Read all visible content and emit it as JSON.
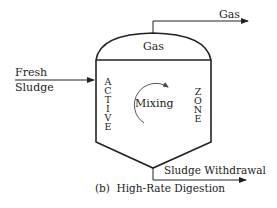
{
  "diagram": {
    "title": "(b)  High-Rate Digestion",
    "labels": {
      "gas_outlet": "Gas",
      "gas_dome": "Gas",
      "fresh_sludge_line1": "Fresh",
      "fresh_sludge_line2": "Sludge",
      "active_zone_left": [
        "A",
        "C",
        "T",
        "I",
        "V",
        "E"
      ],
      "active_zone_right": [
        "Z",
        "O",
        "N",
        "E"
      ],
      "mixing": "Mixing",
      "sludge_withdrawal": "Sludge Withdrawal"
    },
    "colors": {
      "line": "#222222",
      "text": "#222222",
      "background": "#ffffff"
    }
  }
}
